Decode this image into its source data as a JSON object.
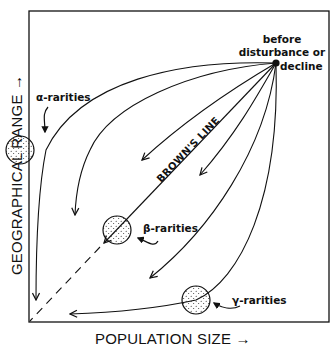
{
  "diagram": {
    "x_axis_label": "POPULATION SIZE →",
    "y_axis_label": "GEOGRAPHICAL RANGE →",
    "origin_label": "before disturbance or decline",
    "origin_lines": [
      "before",
      "disturbance or",
      "decline"
    ],
    "diagonal_label": "BROWN'S LINE",
    "rarity_labels": {
      "alpha": "α-rarities",
      "beta": "β-rarities",
      "gamma": "γ-rarities"
    },
    "colors": {
      "ink": "#111111",
      "background": "#ffffff"
    }
  }
}
